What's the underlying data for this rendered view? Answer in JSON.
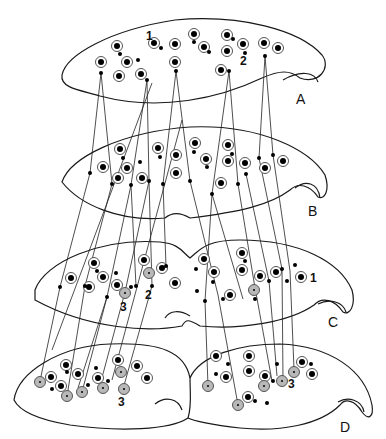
{
  "figure": {
    "panel_labels": [
      {
        "id": "A",
        "text": "A",
        "x": 296,
        "y": 104
      },
      {
        "id": "B",
        "text": "B",
        "x": 308,
        "y": 216
      },
      {
        "id": "C",
        "text": "C",
        "x": 328,
        "y": 327
      },
      {
        "id": "D",
        "text": "D",
        "x": 340,
        "y": 432
      }
    ],
    "number_labels": [
      {
        "text": "1",
        "x": 146,
        "y": 40
      },
      {
        "text": "2",
        "x": 240,
        "y": 65
      },
      {
        "text": "3",
        "x": 120,
        "y": 311
      },
      {
        "text": "2",
        "x": 145,
        "y": 299
      },
      {
        "text": "1",
        "x": 310,
        "y": 282
      },
      {
        "text": "3",
        "x": 118,
        "y": 406
      },
      {
        "text": "3",
        "x": 288,
        "y": 388
      }
    ]
  }
}
